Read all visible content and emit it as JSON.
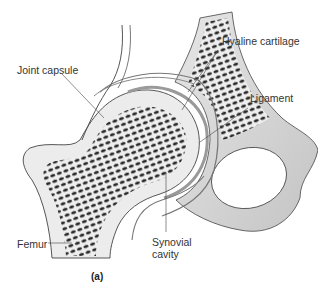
{
  "figure": {
    "panel_label": "(a)",
    "labels": {
      "joint_capsule": "Joint capsule",
      "hyaline_cartilage": "Hyaline cartilage",
      "ligament": "Ligament",
      "femur": "Femur",
      "synovial_line1": "Synovial",
      "synovial_line2": "cavity"
    },
    "colors": {
      "spongy_bone": "#2a2a2a",
      "compact_bone": "#ececec",
      "cartilage": "#d6d6d6",
      "outline": "#444444",
      "pelvis_shade": "#cfcfcf"
    }
  }
}
